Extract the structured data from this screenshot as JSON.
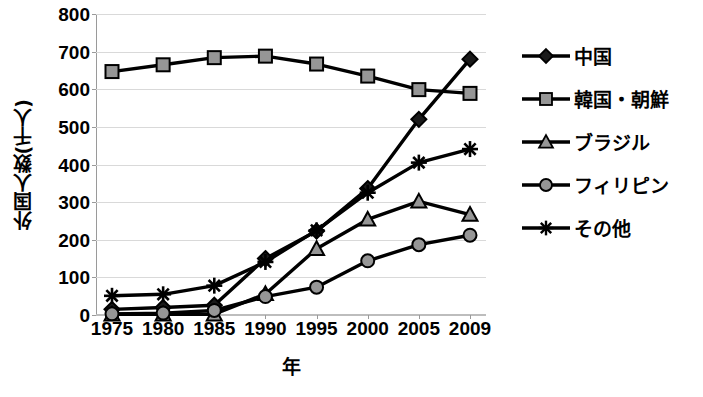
{
  "chart_data": {
    "type": "line",
    "title": "",
    "xlabel": "年",
    "ylabel": "外国人数(千人)",
    "categories": [
      "1975",
      "1980",
      "1985",
      "1990",
      "1995",
      "2000",
      "2005",
      "2009"
    ],
    "x": [
      1975,
      1980,
      1985,
      1990,
      1995,
      2000,
      2005,
      2009
    ],
    "ylim": [
      0,
      800
    ],
    "yticks": [
      "800",
      "700",
      "600",
      "500",
      "400",
      "300",
      "200",
      "100",
      "0"
    ],
    "ytick_values": [
      800,
      700,
      600,
      500,
      400,
      300,
      200,
      100,
      0
    ],
    "grid": true,
    "legend_position": "right",
    "series": [
      {
        "name": "中国",
        "marker": "diamond",
        "values": [
          15,
          20,
          26,
          150,
          223,
          336,
          520,
          680
        ]
      },
      {
        "name": "韓国・朝鮮",
        "marker": "square",
        "values": [
          647,
          665,
          684,
          688,
          667,
          635,
          599,
          589
        ]
      },
      {
        "name": "ブラジル",
        "marker": "triangle",
        "values": [
          2,
          2,
          2,
          56,
          176,
          254,
          302,
          267
        ]
      },
      {
        "name": "フィリピン",
        "marker": "circle",
        "values": [
          3,
          5,
          12,
          49,
          74,
          144,
          187,
          212
        ]
      },
      {
        "name": "その他",
        "marker": "asterisk",
        "values": [
          51,
          55,
          78,
          141,
          225,
          325,
          405,
          441
        ]
      }
    ]
  },
  "colors": {
    "line": "#000000",
    "marker_fill": "#969696",
    "marker_stroke": "#000000",
    "grid": "#d9d9d9",
    "axis": "#9a9a9a",
    "text": "#000000",
    "background": "#ffffff"
  },
  "axis": {
    "y_title": "外国人数(千人)",
    "x_title": "年"
  }
}
